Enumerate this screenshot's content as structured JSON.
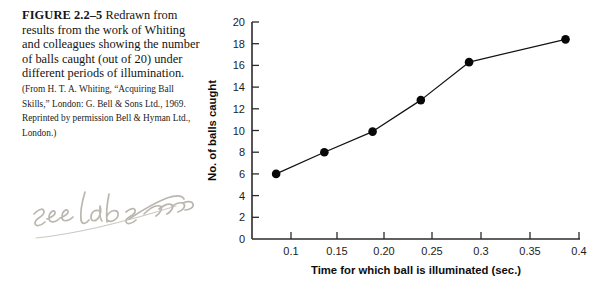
{
  "figure": {
    "label": "FIGURE 2.2–5",
    "caption": "Redrawn from results from the work of Whiting and colleagues showing the number of balls caught (out of 20) under different periods of illumination.",
    "source": "(From H. T. A. Whiting, “Acquiring Ball Skills,” London: G. Bell & Sons Ltd., 1969. Reprinted by permission Bell & Hyman Ltd., London.)"
  },
  "annotation": {
    "handwritten_note": "see lab software",
    "ink_color": "#b9b5ad"
  },
  "chart_data": {
    "type": "line",
    "title": "",
    "xlabel": "Time for which ball is illuminated (sec.)",
    "ylabel": "No. of balls caught",
    "x": [
      0.1,
      0.15,
      0.2,
      0.25,
      0.3,
      0.4
    ],
    "values": [
      6.0,
      8.0,
      9.9,
      12.8,
      16.3,
      18.4
    ],
    "xlim": [
      0.075,
      0.415
    ],
    "ylim": [
      0,
      20
    ],
    "xticks": [
      0.1,
      0.15,
      0.2,
      0.25,
      0.3,
      0.35,
      0.4
    ],
    "xticklabels": [
      "0.1",
      "0.15",
      "0.20",
      "0.25",
      "0.3",
      "0.35",
      "0.4"
    ],
    "yticks": [
      0,
      2,
      4,
      6,
      8,
      10,
      12,
      14,
      16,
      18,
      20
    ],
    "yticklabels": [
      "0",
      "2",
      "4",
      "6",
      "8",
      "10",
      "12",
      "14",
      "16",
      "18",
      "20"
    ],
    "grid": false,
    "legend": false,
    "marker": "filled-circle",
    "line_color": "#111111"
  }
}
